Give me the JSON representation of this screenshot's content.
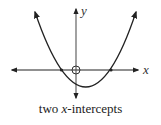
{
  "diagram": {
    "type": "parabola-graph",
    "axes": {
      "x_label": "x",
      "y_label": "y",
      "origin_marker": "open-circle"
    },
    "curve": {
      "shape": "upward-opening parabola",
      "vertex_position": "below x-axis, right of y-axis",
      "x_intercept_count": 2,
      "ends": "arrows at both ends"
    },
    "colors": {
      "curve": "#222222",
      "axes": "#222222",
      "background": "#ffffff"
    }
  },
  "caption": {
    "prefix": "two ",
    "variable": "x",
    "suffix": "-intercepts"
  }
}
